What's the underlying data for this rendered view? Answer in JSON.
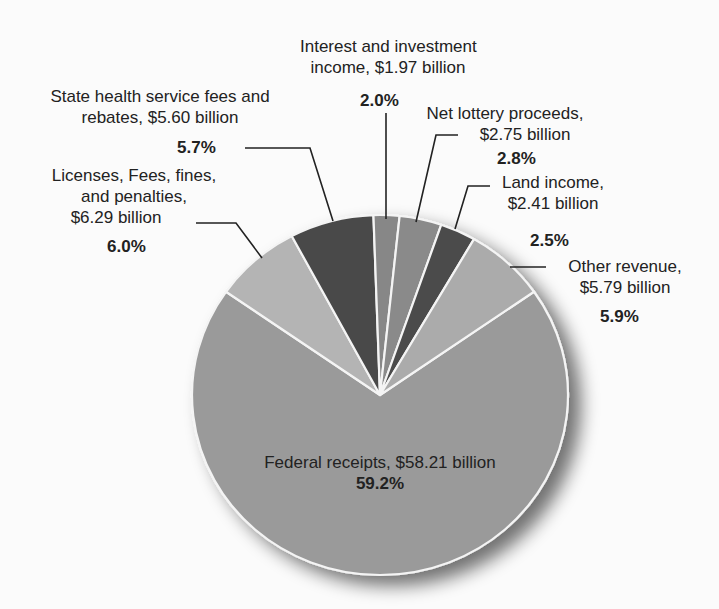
{
  "chart_data": {
    "type": "pie",
    "title": "",
    "slices": [
      {
        "label": "Federal receipts",
        "value_billion": 58.21,
        "value_text": "$58.21 billion",
        "percent": 59.2,
        "percent_text": "59.2%",
        "color": "#9a9a9a",
        "start_deg": 55,
        "end_deg": 305
      },
      {
        "label": "Licenses, Fees, fines, and penalties",
        "value_billion": 6.29,
        "value_text": "$6.29 billion",
        "percent": 6.0,
        "percent_text": "6.0%",
        "color": "#b4b4b4",
        "start_deg": 305,
        "end_deg": 332
      },
      {
        "label": "State health service fees and rebates",
        "value_billion": 5.6,
        "value_text": "$5.60 billion",
        "percent": 5.7,
        "percent_text": "5.7%",
        "color": "#4a4a4a",
        "start_deg": 332,
        "end_deg": 358
      },
      {
        "label": "Interest and investment income",
        "value_billion": 1.97,
        "value_text": "$1.97 billion",
        "percent": 2.0,
        "percent_text": "2.0%",
        "color": "#878787",
        "start_deg": 358,
        "end_deg": 366
      },
      {
        "label": "Net lottery proceeds",
        "value_billion": 2.75,
        "value_text": "$2.75 billion",
        "percent": 2.8,
        "percent_text": "2.8%",
        "color": "#8a8a8a",
        "start_deg": 366,
        "end_deg": 379
      },
      {
        "label": "Land income",
        "value_billion": 2.41,
        "value_text": "$2.41 billion",
        "percent": 2.5,
        "percent_text": "2.5%",
        "color": "#4c4c4c",
        "start_deg": 379,
        "end_deg": 390
      },
      {
        "label": "Other revenue",
        "value_billion": 5.79,
        "value_text": "$5.79 billion",
        "percent": 5.9,
        "percent_text": "5.9%",
        "color": "#ababab",
        "start_deg": 390,
        "end_deg": 415
      }
    ],
    "legend": "none (callout labels)"
  },
  "geometry": {
    "cx": 380,
    "cy": 395,
    "rx": 188,
    "ry": 180,
    "stroke": "#f4f4f4"
  },
  "labels": {
    "interest": {
      "line1": "Interest and investment",
      "line2": "income, $1.97 billion",
      "pct": "2.0%"
    },
    "state_health": {
      "line1": "State health service fees and",
      "line2": "rebates, $5.60 billion",
      "pct": "5.7%"
    },
    "net_lottery": {
      "line1": "Net lottery proceeds,",
      "line2": "$2.75 billion",
      "pct": "2.8%"
    },
    "licenses": {
      "line1": "Licenses, Fees, fines,",
      "line2": "and penalties,",
      "line3": "$6.29 billion",
      "pct": "6.0%"
    },
    "land": {
      "line1": "Land income,",
      "line2": "$2.41 billion",
      "pct": "2.5%"
    },
    "other": {
      "line1": "Other revenue,",
      "line2": "$5.79 billion",
      "pct": "5.9%"
    },
    "federal": {
      "line1": "Federal receipts, $58.21 billion",
      "pct": "59.2%"
    }
  }
}
